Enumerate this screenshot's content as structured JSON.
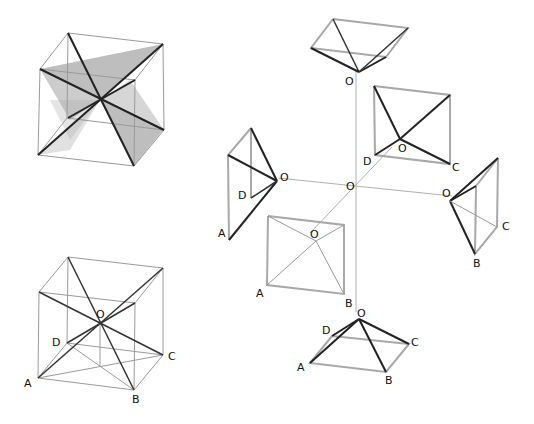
{
  "figure": {
    "labels": {
      "O": "O",
      "A": "A",
      "B": "B",
      "C": "C",
      "D": "D"
    },
    "colors": {
      "background": "#ffffff",
      "edge_dark": "#222222",
      "edge_grey": "#a8a8a8",
      "face_shade": "#7a7a7a"
    },
    "panels": [
      {
        "id": "shaded-cube",
        "label": ""
      },
      {
        "id": "labeled-cube",
        "label": "Cube with diagonals through O"
      },
      {
        "id": "exploded-pyramids",
        "label": "Six pyramids with apex O"
      }
    ]
  }
}
